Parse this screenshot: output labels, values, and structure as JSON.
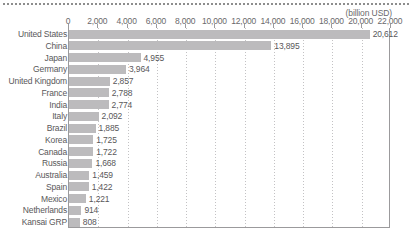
{
  "chart_data": {
    "type": "bar",
    "orientation": "horizontal",
    "title": "",
    "unit_label": "(billion USD)",
    "xlabel": "",
    "ylabel": "",
    "xlim": [
      0,
      22000
    ],
    "xtick_step": 2000,
    "xticks": [
      "0",
      "2,000",
      "4,000",
      "6,000",
      "8,000",
      "10,000",
      "12,000",
      "14,000",
      "16,000",
      "18,000",
      "20,000",
      "22,000"
    ],
    "grid": "vertical-dotted",
    "legend": "none",
    "bar_color": "#bcbbbd",
    "categories": [
      "United States",
      "China",
      "Japan",
      "Germany",
      "United Kingdom",
      "France",
      "India",
      "Italy",
      "Brazil",
      "Korea",
      "Canada",
      "Russia",
      "Australia",
      "Spain",
      "Mexico",
      "Netherlands",
      "Kansai GRP"
    ],
    "values": [
      20612,
      13895,
      4955,
      3964,
      2857,
      2788,
      2774,
      2092,
      1885,
      1725,
      1722,
      1668,
      1459,
      1422,
      1221,
      914,
      808
    ],
    "value_labels": [
      "20,612",
      "13,895",
      "4,955",
      "3,964",
      "2,857",
      "2,788",
      "2,774",
      "2,092",
      "1,885",
      "1,725",
      "1,722",
      "1,668",
      "1,459",
      "1,422",
      "1,221",
      "914",
      "808"
    ]
  }
}
